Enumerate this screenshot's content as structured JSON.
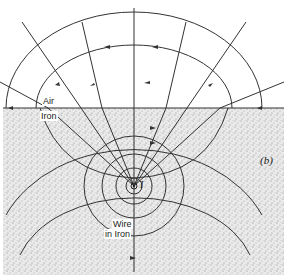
{
  "diagram": {
    "panel_label": "(b)",
    "regions": {
      "upper": "Air",
      "lower": "Iron"
    },
    "wire_label_line1": "Wire",
    "wire_label_line2": "in Iron",
    "current_symbol": "I",
    "colors": {
      "line": "#333333",
      "iron_fill": "#e4e4e4",
      "background": "#ffffff"
    }
  }
}
